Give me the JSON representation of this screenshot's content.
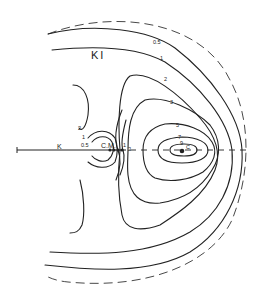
{
  "figure": {
    "title": "KI",
    "axis": {
      "left_marker": "K",
      "center_marker": "C.M.",
      "right_marker": "C"
    },
    "contour_levels": [
      "0.5",
      "1",
      "2",
      "3",
      "5",
      "7",
      "9"
    ],
    "labels": {
      "outer_05": "0.5",
      "outer_1": "1",
      "lvl_2": "2",
      "lvl_3": "3",
      "lvl_5": "5",
      "lvl_7": "7",
      "lvl_9": "9",
      "left_2": "2",
      "left_1": "1",
      "left_05": "0.5",
      "mid_1": "1",
      "mid_2": "2"
    },
    "colors": {
      "ink": "#222222",
      "background": "#ffffff"
    }
  }
}
